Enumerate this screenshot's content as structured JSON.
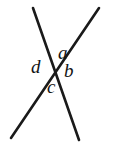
{
  "figure": {
    "type": "geometry-diagram",
    "background_color": "#ffffff",
    "line_color": "#1a1a1a",
    "label_color": "#141414",
    "line_width": 2.6,
    "intersection_point": {
      "x": 56,
      "y": 72
    },
    "lines": [
      {
        "name": "line-top-left-to-bottom-right",
        "x1": 33,
        "y1": 8,
        "x2": 79,
        "y2": 140
      },
      {
        "name": "line-top-right-to-bottom-left",
        "x1": 99,
        "y1": 8,
        "x2": 11,
        "y2": 138
      }
    ],
    "labels": [
      {
        "id": "a",
        "text": "a",
        "x": 58,
        "y": 43,
        "position": "top"
      },
      {
        "id": "b",
        "text": "b",
        "x": 64,
        "y": 61,
        "position": "right"
      },
      {
        "id": "c",
        "text": "c",
        "x": 47,
        "y": 77,
        "position": "bottom"
      },
      {
        "id": "d",
        "text": "d",
        "x": 31,
        "y": 57,
        "position": "left"
      }
    ]
  }
}
